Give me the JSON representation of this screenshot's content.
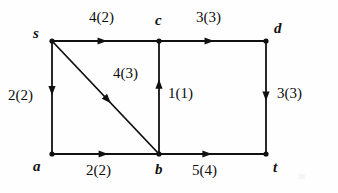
{
  "diagram": {
    "label_format": "capacity(flow)",
    "stroke_color": "#111111",
    "background_color": "#fefefe",
    "nodes": [
      {
        "id": "s",
        "label": "s",
        "x": 52,
        "y": 41,
        "label_x": 33,
        "label_y": 26
      },
      {
        "id": "c",
        "label": "c",
        "x": 159,
        "y": 41,
        "label_x": 155,
        "label_y": 13
      },
      {
        "id": "d",
        "label": "d",
        "x": 266,
        "y": 41,
        "label_x": 274,
        "label_y": 21
      },
      {
        "id": "a",
        "label": "a",
        "x": 52,
        "y": 154,
        "label_x": 33,
        "label_y": 159
      },
      {
        "id": "b",
        "label": "b",
        "x": 159,
        "y": 154,
        "label_x": 155,
        "label_y": 162
      },
      {
        "id": "t",
        "label": "t",
        "x": 266,
        "y": 154,
        "label_x": 273,
        "label_y": 160
      }
    ],
    "edges": [
      {
        "id": "s-c",
        "from": "s",
        "to": "c",
        "capacity": 4,
        "flow": 2,
        "label": "4(2)",
        "label_x": 89,
        "label_y": 10,
        "arrow_t": 0.47
      },
      {
        "id": "c-d",
        "from": "c",
        "to": "d",
        "capacity": 3,
        "flow": 3,
        "label": "3(3)",
        "label_x": 196,
        "label_y": 10,
        "arrow_t": 0.47
      },
      {
        "id": "s-a",
        "from": "s",
        "to": "a",
        "capacity": 2,
        "flow": 2,
        "label": "2(2)",
        "label_x": 8,
        "label_y": 88,
        "arrow_t": 0.44
      },
      {
        "id": "s-b",
        "from": "s",
        "to": "b",
        "capacity": 4,
        "flow": 3,
        "label": "4(3)",
        "label_x": 113,
        "label_y": 66,
        "arrow_t": 0.52
      },
      {
        "id": "b-c",
        "from": "b",
        "to": "c",
        "capacity": 1,
        "flow": 1,
        "label": "1(1)",
        "label_x": 168,
        "label_y": 86,
        "arrow_t": 0.62
      },
      {
        "id": "d-t",
        "from": "d",
        "to": "t",
        "capacity": 3,
        "flow": 3,
        "label": "3(3)",
        "label_x": 277,
        "label_y": 86,
        "arrow_t": 0.49
      },
      {
        "id": "a-b",
        "from": "a",
        "to": "b",
        "capacity": 2,
        "flow": 2,
        "label": "2(2)",
        "label_x": 86,
        "label_y": 163,
        "arrow_t": 0.48
      },
      {
        "id": "b-t",
        "from": "b",
        "to": "t",
        "capacity": 5,
        "flow": 4,
        "label": "5(4)",
        "label_x": 192,
        "label_y": 163,
        "arrow_t": 0.45
      }
    ]
  }
}
